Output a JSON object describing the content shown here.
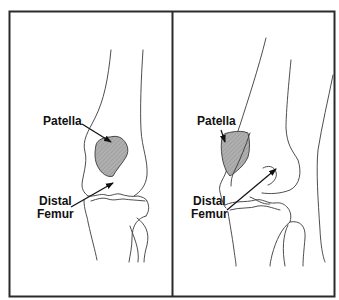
{
  "figure": {
    "panels": [
      {
        "id": "left",
        "view": "frontal",
        "labels": {
          "patella": "Patella",
          "distal_femur_line1": "Distal",
          "distal_femur_line2": "Femur"
        }
      },
      {
        "id": "right",
        "view": "oblique",
        "labels": {
          "patella": "Patella",
          "distal_femur_line1": "Distal",
          "distal_femur_line2": "Femur"
        }
      }
    ],
    "colors": {
      "frame": "#2b2b2b",
      "outline": "#3a3a3a",
      "patella_fill": "#a8a8a8",
      "text": "#111111",
      "background": "#ffffff"
    }
  }
}
